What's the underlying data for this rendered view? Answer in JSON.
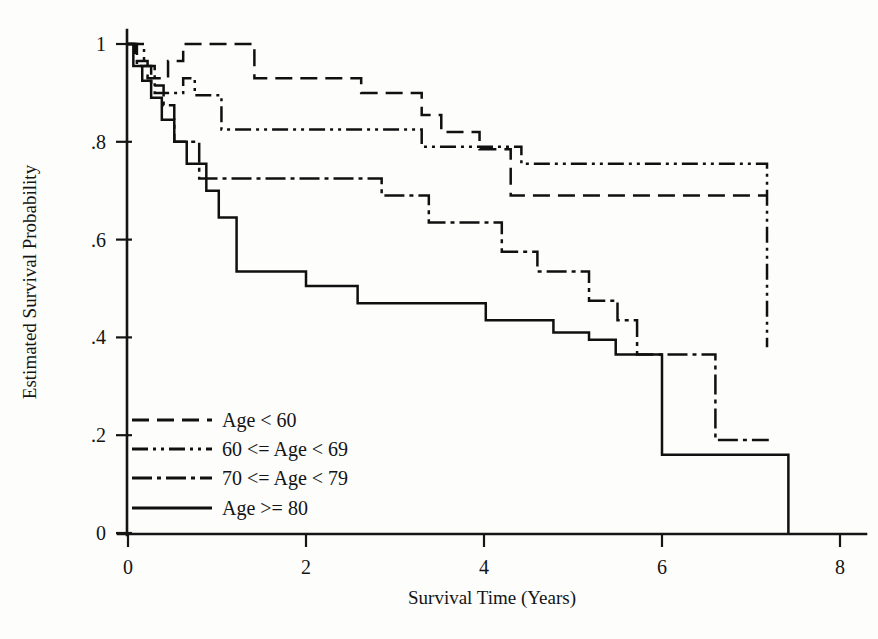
{
  "chart_data": {
    "type": "line",
    "subtype": "kaplan-meier-step",
    "title": "",
    "xlabel": "Survival Time (Years)",
    "ylabel": "Estimated Survival Probability",
    "xlim": [
      -0.3,
      8.3
    ],
    "ylim": [
      0,
      1.02
    ],
    "xticks": [
      0,
      2,
      4,
      6,
      8
    ],
    "xtick_labels": [
      "0",
      "2",
      "4",
      "6",
      "8"
    ],
    "yticks": [
      0,
      0.2,
      0.4,
      0.6,
      0.8,
      1
    ],
    "ytick_labels": [
      "0",
      ".2",
      ".4",
      ".6",
      ".8",
      "1"
    ],
    "grid": false,
    "legend_position": "lower-left-inside",
    "series": [
      {
        "name": "Age < 60",
        "linestyle": "dashed",
        "dasharray": "17 8",
        "color": "#101010",
        "x": [
          0.0,
          0.08,
          0.08,
          0.22,
          0.22,
          0.45,
          0.45,
          0.62,
          0.62,
          1.42,
          1.42,
          2.62,
          2.62,
          3.3,
          3.3,
          3.52,
          3.52,
          3.95,
          3.95,
          4.3,
          4.3,
          7.18
        ],
        "y": [
          1.0,
          1.0,
          0.965,
          0.965,
          0.93,
          0.93,
          0.965,
          0.965,
          1.0,
          1.0,
          0.93,
          0.93,
          0.9,
          0.9,
          0.855,
          0.855,
          0.82,
          0.82,
          0.785,
          0.785,
          0.69,
          0.69
        ]
      },
      {
        "name": "60 <= Age < 69",
        "linestyle": "dash-dot-dot",
        "dasharray": "16 5 3 5 3 5",
        "color": "#101010",
        "x": [
          0.0,
          0.18,
          0.18,
          0.3,
          0.3,
          0.62,
          0.62,
          0.75,
          0.75,
          1.05,
          1.05,
          3.3,
          3.3,
          4.42,
          4.42,
          7.18,
          7.18
        ],
        "y": [
          1.0,
          1.0,
          0.955,
          0.955,
          0.9,
          0.9,
          0.93,
          0.93,
          0.895,
          0.895,
          0.825,
          0.825,
          0.79,
          0.79,
          0.755,
          0.755,
          0.38
        ]
      },
      {
        "name": "70 <= Age < 79",
        "linestyle": "long-dash-dot",
        "dasharray": "20 5 4 5",
        "color": "#101010",
        "x": [
          0.0,
          0.1,
          0.1,
          0.26,
          0.26,
          0.4,
          0.4,
          0.52,
          0.52,
          0.8,
          0.8,
          2.85,
          2.85,
          3.38,
          3.38,
          4.2,
          4.2,
          4.6,
          4.6,
          5.18,
          5.18,
          5.5,
          5.5,
          5.72,
          5.72,
          6.6,
          6.6,
          7.2
        ],
        "y": [
          1.0,
          1.0,
          0.955,
          0.955,
          0.915,
          0.915,
          0.875,
          0.875,
          0.8,
          0.8,
          0.725,
          0.725,
          0.69,
          0.69,
          0.635,
          0.635,
          0.575,
          0.575,
          0.535,
          0.535,
          0.475,
          0.475,
          0.435,
          0.435,
          0.365,
          0.365,
          0.19,
          0.19
        ]
      },
      {
        "name": "Age >= 80",
        "linestyle": "solid",
        "dasharray": "none",
        "color": "#101010",
        "x": [
          0.0,
          0.06,
          0.06,
          0.16,
          0.16,
          0.26,
          0.26,
          0.38,
          0.38,
          0.52,
          0.52,
          0.66,
          0.66,
          0.88,
          0.88,
          1.02,
          1.02,
          1.22,
          1.22,
          2.0,
          2.0,
          2.58,
          2.58,
          4.02,
          4.02,
          4.78,
          4.78,
          5.18,
          5.18,
          5.48,
          5.48,
          5.72,
          5.72,
          6.0,
          6.0,
          7.42,
          7.42
        ],
        "y": [
          1.0,
          1.0,
          0.955,
          0.955,
          0.925,
          0.925,
          0.89,
          0.89,
          0.845,
          0.845,
          0.8,
          0.8,
          0.755,
          0.755,
          0.7,
          0.7,
          0.645,
          0.645,
          0.535,
          0.535,
          0.505,
          0.505,
          0.47,
          0.47,
          0.435,
          0.435,
          0.41,
          0.41,
          0.395,
          0.395,
          0.365,
          0.365,
          0.365,
          0.365,
          0.16,
          0.16,
          0.0
        ]
      }
    ],
    "legend": [
      {
        "label": "Age < 60",
        "dasharray": "17 8"
      },
      {
        "label": "60 <= Age < 69",
        "dasharray": "16 5 3 5 3 5"
      },
      {
        "label": "70 <= Age < 79",
        "dasharray": "20 5 4 5"
      },
      {
        "label": "Age >= 80",
        "dasharray": "none"
      }
    ]
  },
  "axes": {
    "x_title": "Survival Time (Years)",
    "y_title": "Estimated Survival Probability"
  },
  "colors": {
    "ink": "#101010",
    "background": "#fdfdfc"
  }
}
